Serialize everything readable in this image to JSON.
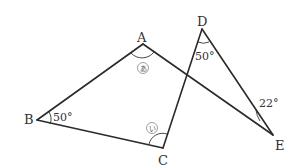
{
  "points": {
    "A": {
      "label": "A"
    },
    "B": {
      "label": "B"
    },
    "C": {
      "label": "C"
    },
    "D": {
      "label": "D"
    },
    "E": {
      "label": "E"
    }
  },
  "segments": [
    [
      "A",
      "B"
    ],
    [
      "B",
      "C"
    ],
    [
      "C",
      "D"
    ],
    [
      "D",
      "E"
    ],
    [
      "A",
      "E"
    ]
  ],
  "angles": {
    "B": {
      "text": "50°"
    },
    "D": {
      "text": "50°"
    },
    "E": {
      "text": "22°"
    },
    "A": {
      "text": "あ",
      "unknown": true
    },
    "C": {
      "text": "い",
      "unknown": true
    }
  }
}
